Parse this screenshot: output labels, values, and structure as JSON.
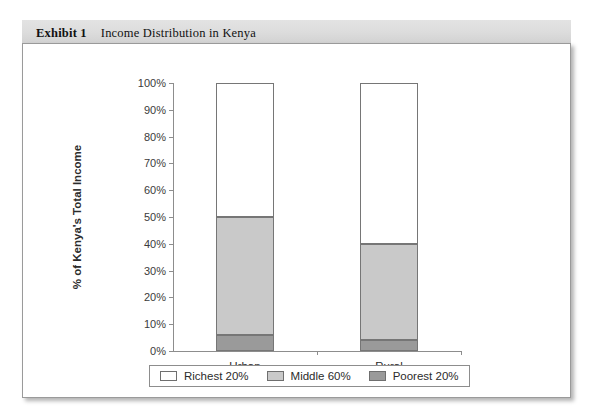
{
  "exhibit": {
    "label": "Exhibit 1",
    "title": "Income Distribution in Kenya"
  },
  "colors": {
    "richest": "#ffffff",
    "middle": "#c9c9c9",
    "poorest": "#9a9a9a",
    "axis": "#8d8d8d",
    "header_band": "#dcdcdc",
    "panel_border": "#9a9a9a"
  },
  "chart_data": {
    "type": "bar",
    "stacked": true,
    "title": "Income Distribution in Kenya",
    "xlabel": "",
    "ylabel": "% of Kenya's Total Income",
    "categories": [
      "Urban",
      "Rural"
    ],
    "ylim": [
      0,
      100
    ],
    "ytick_labels": [
      "0%",
      "10%",
      "20%",
      "30%",
      "40%",
      "50%",
      "60%",
      "70%",
      "80%",
      "90%",
      "100%"
    ],
    "ytick_values": [
      0,
      10,
      20,
      30,
      40,
      50,
      60,
      70,
      80,
      90,
      100
    ],
    "grid": false,
    "legend_position": "bottom",
    "series": [
      {
        "name": "Poorest 20%",
        "color": "#9a9a9a",
        "values": [
          6,
          4
        ]
      },
      {
        "name": "Middle 60%",
        "color": "#c9c9c9",
        "values": [
          44,
          36
        ]
      },
      {
        "name": "Richest 20%",
        "color": "#ffffff",
        "values": [
          50,
          60
        ]
      }
    ],
    "cumulative_tops": {
      "Urban": {
        "poorest": 6,
        "middle": 50,
        "richest": 100
      },
      "Rural": {
        "poorest": 4,
        "middle": 40,
        "richest": 100
      }
    }
  },
  "legend": {
    "items": [
      {
        "label": "Richest 20%",
        "swatch": "#ffffff"
      },
      {
        "label": "Middle 60%",
        "swatch": "#c9c9c9"
      },
      {
        "label": "Poorest 20%",
        "swatch": "#9a9a9a"
      }
    ]
  }
}
